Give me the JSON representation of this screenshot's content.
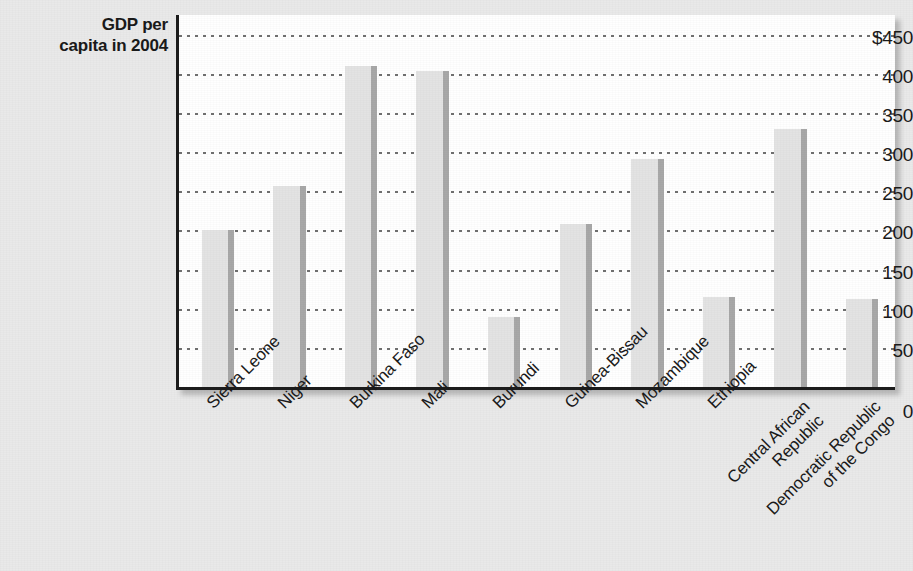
{
  "chart_data": {
    "type": "bar",
    "title": "",
    "axis_title": "GDP per\ncapita in 2004",
    "xlabel": "",
    "ylabel": "GDP per capita in 2004",
    "ylim": [
      0,
      475
    ],
    "grid": true,
    "legend": "none",
    "tick_labels": [
      "$450",
      "400",
      "350",
      "300",
      "250",
      "200",
      "150",
      "100",
      "50",
      "0"
    ],
    "ticks": [
      450,
      400,
      350,
      300,
      250,
      200,
      150,
      100,
      50,
      0
    ],
    "zero_label": "0",
    "categories": [
      "Sierra Leone",
      "Niger",
      "Burkina Faso",
      "Mali",
      "Burundi",
      "Guinea-Bissau",
      "Mozambique",
      "Ethiopia",
      "Central African\nRepublic",
      "Democratic Republic\nof the Congo"
    ],
    "values": [
      200,
      257,
      410,
      404,
      90,
      208,
      291,
      115,
      330,
      112
    ],
    "bar_fill": "#e3e3e3",
    "bar_edge": "#a8a8a8",
    "axis_color": "#1c1c1c",
    "grid_color": "#707070",
    "plot_background": "#ffffff",
    "page_background": "#e9e9e9"
  }
}
